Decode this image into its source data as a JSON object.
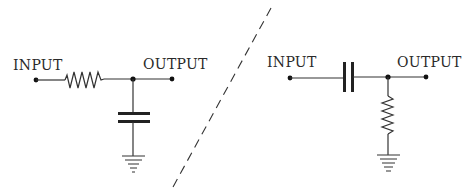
{
  "diagram": {
    "type": "RC filter schematics",
    "left_circuit": {
      "name": "low-pass RC filter",
      "input_label": "INPUT",
      "output_label": "OUTPUT",
      "series_component": "resistor",
      "shunt_component": "capacitor",
      "shunt_to": "ground"
    },
    "right_circuit": {
      "name": "high-pass CR filter",
      "input_label": "INPUT",
      "output_label": "OUTPUT",
      "series_component": "capacitor",
      "shunt_component": "resistor",
      "shunt_to": "ground"
    },
    "separator": "dashed diagonal line"
  }
}
